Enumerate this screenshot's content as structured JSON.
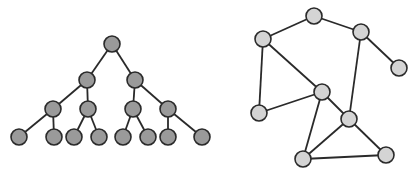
{
  "diagram": {
    "width": 416,
    "height": 172,
    "colors": {
      "background": "#ffffff",
      "edge": "#2a2a2a",
      "node_stroke": "#2a2a2a",
      "tree_node_fill": "#9a9a9a",
      "graph_node_fill": "#d4d4d4"
    },
    "node_radius": 8,
    "tree": {
      "name": "binary-tree",
      "nodes": [
        {
          "id": "t0",
          "x": 112,
          "y": 44
        },
        {
          "id": "t1",
          "x": 87,
          "y": 80
        },
        {
          "id": "t2",
          "x": 135,
          "y": 80
        },
        {
          "id": "t3",
          "x": 53,
          "y": 109
        },
        {
          "id": "t4",
          "x": 88,
          "y": 109
        },
        {
          "id": "t5",
          "x": 133,
          "y": 109
        },
        {
          "id": "t6",
          "x": 168,
          "y": 109
        },
        {
          "id": "t7",
          "x": 19,
          "y": 137
        },
        {
          "id": "t8",
          "x": 54,
          "y": 137
        },
        {
          "id": "t9",
          "x": 74,
          "y": 137
        },
        {
          "id": "t10",
          "x": 99,
          "y": 137
        },
        {
          "id": "t11",
          "x": 123,
          "y": 137
        },
        {
          "id": "t12",
          "x": 148,
          "y": 137
        },
        {
          "id": "t13",
          "x": 168,
          "y": 137
        },
        {
          "id": "t14",
          "x": 202,
          "y": 137
        }
      ],
      "edges": [
        [
          "t0",
          "t1"
        ],
        [
          "t0",
          "t2"
        ],
        [
          "t1",
          "t3"
        ],
        [
          "t1",
          "t4"
        ],
        [
          "t2",
          "t5"
        ],
        [
          "t2",
          "t6"
        ],
        [
          "t3",
          "t7"
        ],
        [
          "t3",
          "t8"
        ],
        [
          "t4",
          "t9"
        ],
        [
          "t4",
          "t10"
        ],
        [
          "t5",
          "t11"
        ],
        [
          "t5",
          "t12"
        ],
        [
          "t6",
          "t13"
        ],
        [
          "t6",
          "t14"
        ]
      ]
    },
    "graph": {
      "name": "general-graph",
      "nodes": [
        {
          "id": "A",
          "x": 314,
          "y": 16
        },
        {
          "id": "B",
          "x": 263,
          "y": 39
        },
        {
          "id": "C",
          "x": 361,
          "y": 32
        },
        {
          "id": "D",
          "x": 399,
          "y": 68
        },
        {
          "id": "E",
          "x": 322,
          "y": 92
        },
        {
          "id": "F",
          "x": 259,
          "y": 113
        },
        {
          "id": "G",
          "x": 349,
          "y": 119
        },
        {
          "id": "H",
          "x": 303,
          "y": 159
        },
        {
          "id": "I",
          "x": 386,
          "y": 155
        }
      ],
      "edges": [
        [
          "A",
          "B"
        ],
        [
          "A",
          "C"
        ],
        [
          "C",
          "D"
        ],
        [
          "C",
          "G"
        ],
        [
          "B",
          "F"
        ],
        [
          "B",
          "E"
        ],
        [
          "E",
          "F"
        ],
        [
          "E",
          "G"
        ],
        [
          "E",
          "H"
        ],
        [
          "G",
          "H"
        ],
        [
          "G",
          "I"
        ],
        [
          "H",
          "I"
        ]
      ]
    }
  }
}
